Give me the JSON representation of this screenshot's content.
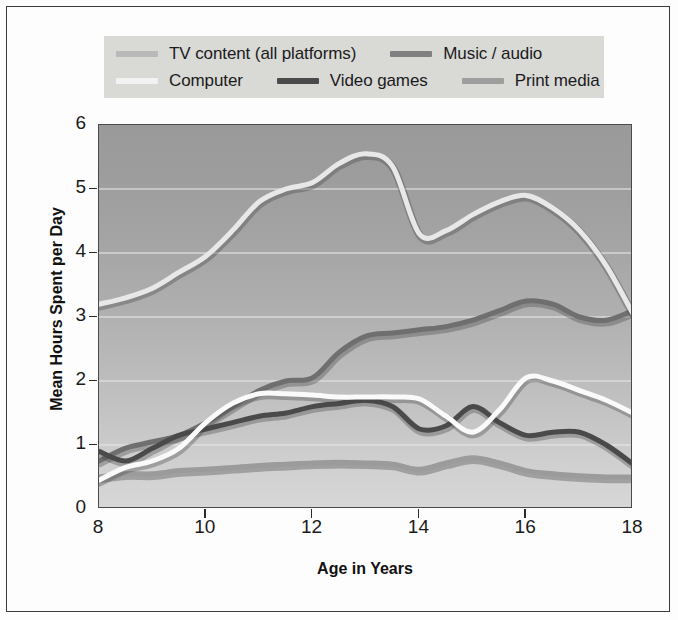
{
  "legend": {
    "rows": [
      [
        {
          "label": "TV content (all platforms)",
          "color": "#b9b9b9",
          "key": "tv"
        },
        {
          "label": "Music / audio",
          "color": "#808080",
          "key": "music"
        }
      ],
      [
        {
          "label": "Computer",
          "color": "#f2f2f2",
          "key": "computer"
        },
        {
          "label": "Video games",
          "color": "#4a4a4a",
          "key": "video_games"
        },
        {
          "label": "Print media",
          "color": "#9e9e9e",
          "key": "print"
        }
      ]
    ]
  },
  "axes": {
    "xlabel": "Age in Years",
    "ylabel": "Mean Hours Spent per Day",
    "xticks": [
      "8",
      "10",
      "12",
      "14",
      "16",
      "18"
    ],
    "yticks": [
      "6",
      "5",
      "4",
      "3",
      "2",
      "1",
      "0"
    ]
  },
  "chart_data": {
    "type": "line",
    "title": "",
    "xlabel": "Age in Years",
    "ylabel": "Mean Hours Spent per Day",
    "xlim": [
      8,
      18
    ],
    "ylim": [
      0,
      6
    ],
    "xticks": [
      8,
      10,
      12,
      14,
      16,
      18
    ],
    "yticks": [
      0,
      1,
      2,
      3,
      4,
      5,
      6
    ],
    "grid": "horizontal",
    "legend_position": "above-plot",
    "x": [
      8,
      8.5,
      9,
      9.5,
      10,
      10.5,
      11,
      11.5,
      12,
      12.5,
      13,
      13.5,
      14,
      14.5,
      15,
      15.5,
      16,
      16.5,
      17,
      17.5,
      18
    ],
    "series": [
      {
        "name": "TV content (all platforms)",
        "color": "#e8e8e8",
        "values": [
          3.2,
          3.3,
          3.45,
          3.7,
          3.95,
          4.35,
          4.8,
          5.0,
          5.1,
          5.4,
          5.55,
          5.35,
          4.3,
          4.35,
          4.6,
          4.8,
          4.9,
          4.7,
          4.35,
          3.8,
          3.05
        ]
      },
      {
        "name": "Music / audio",
        "color": "#6f6f6f",
        "values": [
          0.75,
          0.95,
          1.05,
          1.15,
          1.35,
          1.6,
          1.85,
          2.0,
          2.05,
          2.45,
          2.7,
          2.75,
          2.8,
          2.85,
          2.95,
          3.1,
          3.25,
          3.2,
          3.0,
          2.95,
          3.1
        ]
      },
      {
        "name": "Computer",
        "color": "#fafafa",
        "values": [
          0.45,
          0.65,
          0.75,
          0.95,
          1.35,
          1.65,
          1.8,
          1.8,
          1.78,
          1.75,
          1.75,
          1.75,
          1.72,
          1.45,
          1.2,
          1.55,
          2.05,
          2.0,
          1.85,
          1.7,
          1.5
        ]
      },
      {
        "name": "Video games",
        "color": "#4a4a4a",
        "values": [
          0.9,
          0.75,
          0.95,
          1.15,
          1.25,
          1.35,
          1.45,
          1.5,
          1.6,
          1.65,
          1.7,
          1.6,
          1.25,
          1.3,
          1.6,
          1.35,
          1.15,
          1.2,
          1.2,
          1.0,
          0.7
        ]
      },
      {
        "name": "Print media",
        "color": "#9b9b9b",
        "values": [
          0.5,
          0.55,
          0.55,
          0.6,
          0.62,
          0.65,
          0.68,
          0.7,
          0.72,
          0.73,
          0.72,
          0.7,
          0.62,
          0.72,
          0.8,
          0.72,
          0.6,
          0.55,
          0.52,
          0.5,
          0.5
        ]
      }
    ]
  }
}
